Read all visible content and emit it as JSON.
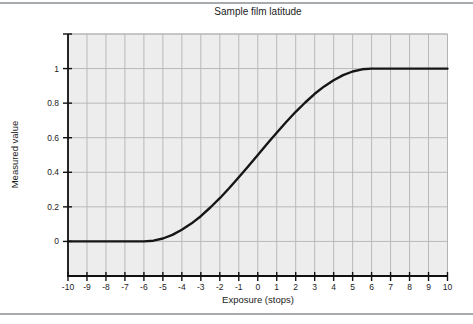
{
  "page": {
    "background": "#ffffff",
    "rule_color": "#a7abae"
  },
  "chart_data": {
    "type": "line",
    "title": "Sample film latitude",
    "xlabel": "Exposure (stops)",
    "ylabel": "Measured value",
    "xlim": [
      -10,
      10
    ],
    "ylim": [
      -0.2,
      1.2
    ],
    "x_ticks": [
      -10,
      -9,
      -8,
      -7,
      -6,
      -5,
      -4,
      -3,
      -2,
      -1,
      0,
      1,
      2,
      3,
      4,
      5,
      6,
      7,
      8,
      9,
      10
    ],
    "x_tick_labels": [
      "-10",
      "-9",
      "-8",
      "-7",
      "-6",
      "-5",
      "-4",
      "-3",
      "-2",
      "-1",
      "0",
      "1",
      "2",
      "3",
      "4",
      "5",
      "6",
      "7",
      "8",
      "9",
      "10"
    ],
    "y_ticks": [
      0,
      0.2,
      0.4,
      0.6,
      0.8,
      1
    ],
    "y_tick_labels": [
      "0",
      "0.2",
      "0.4",
      "0.6",
      "0.8",
      "1"
    ],
    "y_unlabeled_ticks": [
      1.2
    ],
    "grid": true,
    "legend": "none",
    "colors": {
      "curve": "#161616",
      "plot_bg": "#ededed",
      "grid": "#b9b9b9",
      "border": "#b4b4b4",
      "axis": "#111111",
      "text": "#1c1c1c"
    },
    "series": [
      {
        "name": "measured-value-curve",
        "points": [
          [
            -10,
            0
          ],
          [
            -9,
            0
          ],
          [
            -8,
            0
          ],
          [
            -7,
            0
          ],
          [
            -6,
            0
          ],
          [
            -5.5,
            0.004
          ],
          [
            -5,
            0.017
          ],
          [
            -4.5,
            0.038
          ],
          [
            -4,
            0.067
          ],
          [
            -3.5,
            0.103
          ],
          [
            -3,
            0.146
          ],
          [
            -2.5,
            0.196
          ],
          [
            -2,
            0.25
          ],
          [
            -1.5,
            0.309
          ],
          [
            -1,
            0.371
          ],
          [
            -0.5,
            0.435
          ],
          [
            0,
            0.5
          ],
          [
            0.5,
            0.565
          ],
          [
            1,
            0.629
          ],
          [
            1.5,
            0.691
          ],
          [
            2,
            0.75
          ],
          [
            2.5,
            0.804
          ],
          [
            3,
            0.854
          ],
          [
            3.5,
            0.897
          ],
          [
            4,
            0.933
          ],
          [
            4.5,
            0.962
          ],
          [
            5,
            0.983
          ],
          [
            5.5,
            0.996
          ],
          [
            6,
            1
          ],
          [
            7,
            1
          ],
          [
            8,
            1
          ],
          [
            9,
            1
          ],
          [
            10,
            1
          ]
        ]
      }
    ]
  }
}
